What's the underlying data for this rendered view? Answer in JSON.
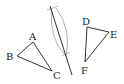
{
  "diagram": {
    "triangle_abc": {
      "A": {
        "label": "A",
        "x": 33,
        "y": 42
      },
      "B": {
        "label": "B",
        "x": 17,
        "y": 56
      },
      "C": {
        "label": "C",
        "x": 52,
        "y": 71
      }
    },
    "triangle_def": {
      "D": {
        "label": "D",
        "x": 87,
        "y": 27
      },
      "E": {
        "label": "E",
        "x": 109,
        "y": 32
      },
      "F": {
        "label": "F",
        "x": 85,
        "y": 62
      }
    },
    "construction_line": {
      "x1": 50,
      "y1": 6,
      "x2": 72,
      "y2": 75
    },
    "colors": {
      "stroke": "#333333",
      "arc": "#999999"
    }
  }
}
